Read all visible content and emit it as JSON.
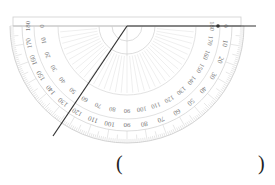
{
  "figure": {
    "type": "protractor-angle-reading",
    "protractor": {
      "orientation": "inverted",
      "center": [
        127,
        26
      ],
      "outer_radius": 117,
      "inner_scale_labels": [
        "180",
        "170",
        "160",
        "150",
        "140",
        "130",
        "120",
        "110",
        "100",
        "90",
        "80",
        "70",
        "60",
        "50",
        "40",
        "30",
        "20",
        "10",
        "0"
      ],
      "outer_scale_labels": [
        "0",
        "10",
        "20",
        "30",
        "40",
        "50",
        "60",
        "70",
        "80",
        "90",
        "100",
        "110",
        "120",
        "130",
        "140",
        "150",
        "160",
        "170",
        "180"
      ],
      "line_color": "#cfcfcf",
      "label_color": "#777777"
    },
    "rays": [
      {
        "name": "ray-horizontal",
        "from": [
          127,
          26
        ],
        "to": [
          256,
          26
        ],
        "color": "#333333",
        "dot_at": [
          218,
          26
        ]
      },
      {
        "name": "ray-oblique",
        "from": [
          127,
          26
        ],
        "to": [
          53,
          136
        ],
        "color": "#333333"
      }
    ],
    "answer_blank": {
      "open": "(",
      "close": ")",
      "value": ""
    }
  }
}
